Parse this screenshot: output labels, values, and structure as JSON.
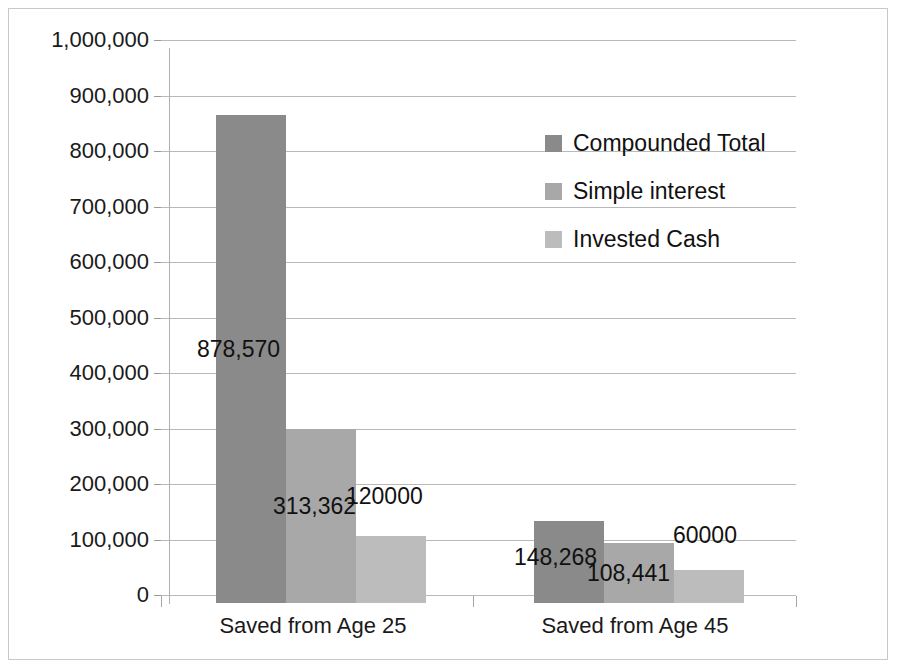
{
  "chart_data": {
    "type": "bar",
    "title": "",
    "xlabel": "",
    "ylabel": "",
    "categories": [
      "Saved from Age 25",
      "Saved from Age 45"
    ],
    "series": [
      {
        "name": "Compounded Total",
        "color": "#8a8a8a",
        "values": [
          878570,
          148268
        ],
        "labels": [
          "878,570",
          "148,268"
        ]
      },
      {
        "name": "Simple interest",
        "color": "#a8a8a8",
        "values": [
          313362,
          108441
        ],
        "labels": [
          "313,362",
          "108,441"
        ]
      },
      {
        "name": "Invested Cash",
        "color": "#bcbcbc",
        "values": [
          120000,
          60000
        ],
        "labels": [
          "120000",
          "60000"
        ]
      }
    ],
    "ylim": [
      0,
      1000000
    ],
    "y_ticks": [
      0,
      100000,
      200000,
      300000,
      400000,
      500000,
      600000,
      700000,
      800000,
      900000,
      1000000
    ],
    "y_tick_labels": [
      "0",
      "100,000",
      "200,000",
      "300,000",
      "400,000",
      "500,000",
      "600,000",
      "700,000",
      "800,000",
      "900,000",
      "1,000,000"
    ],
    "grid": true,
    "legend_position": "inside-upper-right"
  },
  "legend": {
    "items": [
      {
        "label": "Compounded Total",
        "color": "#8a8a8a"
      },
      {
        "label": "Simple interest",
        "color": "#a8a8a8"
      },
      {
        "label": "Invested Cash",
        "color": "#bcbcbc"
      }
    ]
  },
  "axis": {
    "y_labels": [
      "1,000,000",
      "900,000",
      "800,000",
      "700,000",
      "600,000",
      "500,000",
      "400,000",
      "300,000",
      "200,000",
      "100,000",
      "0"
    ],
    "category_labels": [
      "Saved from Age 25",
      "Saved from Age 45"
    ]
  },
  "data_labels": {
    "g1s1": "878,570",
    "g1s2": "313,362",
    "g1s3": "120000",
    "g2s1": "148,268",
    "g2s2": "108,441",
    "g2s3": "60000"
  }
}
